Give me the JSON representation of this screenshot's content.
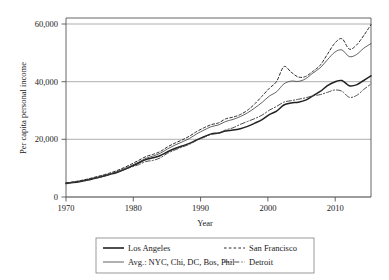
{
  "chart_data": {
    "type": "line",
    "title": "",
    "xlabel": "Year",
    "ylabel": "Per capita personal income",
    "xlim": [
      1970,
      2012
    ],
    "ylim": [
      0,
      62000
    ],
    "grid": true,
    "legend_position": "below",
    "xticks": [
      1970,
      1980,
      1990,
      2000,
      2010
    ],
    "xtick_labels": [
      "1970",
      "1980",
      "1990",
      "2000",
      "2010"
    ],
    "yticks": [
      0,
      20000,
      40000,
      60000
    ],
    "ytick_labels": [
      "0",
      "20,000",
      "40,000",
      "60,000"
    ],
    "x": [
      1970,
      1971,
      1972,
      1973,
      1974,
      1975,
      1976,
      1977,
      1978,
      1979,
      1980,
      1981,
      1982,
      1983,
      1984,
      1985,
      1986,
      1987,
      1988,
      1989,
      1990,
      1991,
      1992,
      1993,
      1994,
      1995,
      1996,
      1997,
      1998,
      1999,
      2000,
      2001,
      2002,
      2003,
      2004,
      2005,
      2006,
      2007,
      2008,
      2009,
      2010,
      2011,
      2012
    ],
    "series": [
      {
        "name": "Los Angeles",
        "style": "solid",
        "width": 1.5,
        "color": "#222222",
        "values": [
          4700,
          5000,
          5400,
          5900,
          6500,
          7100,
          7800,
          8500,
          9500,
          10600,
          11800,
          13000,
          13600,
          14400,
          15700,
          16800,
          17700,
          18600,
          19800,
          20900,
          21900,
          22200,
          22900,
          23200,
          23700,
          24500,
          25600,
          26800,
          28600,
          29800,
          31900,
          32600,
          32900,
          33600,
          35100,
          36600,
          38600,
          39900,
          40400,
          38600,
          38900,
          40400,
          42000
        ]
      },
      {
        "name": "Avg.: NYC, Chi, DC, Bos, Phil",
        "style": "solid",
        "width": 0.8,
        "color": "#3a3a3a",
        "values": [
          4850,
          5150,
          5600,
          6100,
          6700,
          7300,
          8000,
          8800,
          9800,
          10900,
          12100,
          13400,
          14200,
          15200,
          16700,
          18000,
          19100,
          20300,
          21900,
          23200,
          24400,
          25000,
          26200,
          26900,
          27900,
          29200,
          30900,
          32800,
          35000,
          36500,
          39200,
          40200,
          40100,
          41000,
          43000,
          44800,
          47600,
          50200,
          51000,
          48700,
          49400,
          51600,
          53200
        ]
      },
      {
        "name": "San Francisco",
        "style": "dashed",
        "width": 1.0,
        "color": "#2a2a2a",
        "values": [
          4900,
          5250,
          5700,
          6250,
          6900,
          7550,
          8300,
          9150,
          10200,
          11400,
          12700,
          14000,
          14800,
          15800,
          17400,
          18700,
          19800,
          21100,
          22700,
          24000,
          25100,
          25700,
          27100,
          27700,
          28600,
          30100,
          32300,
          35000,
          37700,
          40100,
          45200,
          43300,
          41600,
          41800,
          43600,
          45700,
          49500,
          53300,
          54900,
          51300,
          52700,
          56000,
          59800
        ]
      },
      {
        "name": "Detroit",
        "style": "dashdot",
        "width": 0.9,
        "color": "#3a3a3a",
        "values": [
          4780,
          5080,
          5500,
          6050,
          6550,
          7050,
          7800,
          8600,
          9500,
          10400,
          11200,
          12300,
          12700,
          13600,
          15200,
          16300,
          17300,
          18300,
          19600,
          20700,
          21700,
          22100,
          23300,
          24000,
          25200,
          26200,
          27200,
          28400,
          30100,
          31400,
          32900,
          33400,
          33900,
          34400,
          35100,
          35500,
          36300,
          37100,
          36700,
          34600,
          35200,
          37300,
          39200
        ]
      }
    ]
  },
  "legend": {
    "entries": [
      {
        "label": "Los Angeles",
        "key": "los-angeles"
      },
      {
        "label": "Avg.: NYC, Chi, DC, Bos, Phil",
        "key": "avg-cities"
      },
      {
        "label": "San Francisco",
        "key": "san-francisco"
      },
      {
        "label": "Detroit",
        "key": "detroit"
      }
    ]
  },
  "colors": {
    "axis": "#555555",
    "grid": "#9a9a9a",
    "text": "#1a1a1a",
    "legend_border": "#808080"
  }
}
